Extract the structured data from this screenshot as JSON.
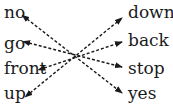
{
  "left_words": [
    "no",
    "go",
    "front",
    "up"
  ],
  "right_words": [
    "down",
    "back",
    "stop",
    "yes"
  ],
  "pairs": [
    {
      "from": "no",
      "to": "yes"
    },
    {
      "from": "go",
      "to": "stop"
    },
    {
      "from": "front",
      "to": "back"
    },
    {
      "from": "up",
      "to": "down"
    }
  ],
  "colors": {
    "text": "#1a1a1a",
    "arrow": "#1a1a1a",
    "background": "#ffffff"
  }
}
